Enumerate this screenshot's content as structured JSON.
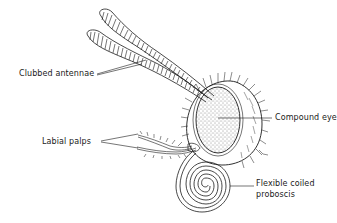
{
  "diagram": {
    "labels": {
      "antennae": "Clubbed antennae",
      "eye": "Compound eye",
      "palps": "Labial palps",
      "proboscis_line1": "Flexible coiled",
      "proboscis_line2": "proboscis"
    },
    "colors": {
      "ink": "#1a1a1a",
      "background": "#ffffff"
    }
  }
}
